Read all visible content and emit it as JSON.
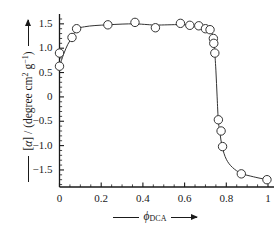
{
  "chart_data": {
    "type": "scatter",
    "title": "",
    "xlabel": "φ_DCA",
    "xlabel_parts": {
      "symbol": "ϕ",
      "subscript": "DCA"
    },
    "ylabel": "[α] / (degree cm² g⁻¹)",
    "ylabel_parts": {
      "bracket_open": "[",
      "symbol": "α",
      "bracket_close": "] / (degree cm",
      "sup1": "2",
      "mid": " g",
      "sup2": "−1",
      "tail": ")"
    },
    "xlim": [
      0,
      1
    ],
    "ylim": [
      -1.85,
      1.62
    ],
    "xticks": [
      0,
      0.2,
      0.4,
      0.6,
      0.8,
      1
    ],
    "xtick_labels": [
      "0",
      "0.2",
      "0.4",
      "0.6",
      "0.8",
      "1"
    ],
    "xminor_step": 0.05,
    "yticks": [
      1.5,
      1.0,
      0.5,
      0,
      -0.5,
      -1.0,
      -1.5
    ],
    "ytick_labels": [
      "1.5",
      "1.0",
      "0.5",
      "0",
      "−0.5",
      "−1.0",
      "−1.5"
    ],
    "yminor_step": 0.1,
    "grid": false,
    "legend": null,
    "frame": "left-bottom",
    "marker": "open-circle",
    "marker_size": 4.2,
    "line_color": "#333333",
    "marker_edge_color": "#333333",
    "marker_face_color": "#ffffff",
    "series": [
      {
        "name": "optical rotation vs DCA volume fraction",
        "points": [
          {
            "x": 0.0,
            "y": 0.9
          },
          {
            "x": 0.0,
            "y": 0.63
          },
          {
            "x": 0.06,
            "y": 1.22
          },
          {
            "x": 0.082,
            "y": 1.4
          },
          {
            "x": 0.232,
            "y": 1.48
          },
          {
            "x": 0.362,
            "y": 1.53
          },
          {
            "x": 0.46,
            "y": 1.42
          },
          {
            "x": 0.58,
            "y": 1.51
          },
          {
            "x": 0.625,
            "y": 1.47
          },
          {
            "x": 0.668,
            "y": 1.46
          },
          {
            "x": 0.7,
            "y": 1.4
          },
          {
            "x": 0.722,
            "y": 1.38
          },
          {
            "x": 0.738,
            "y": 1.2
          },
          {
            "x": 0.74,
            "y": 1.1
          },
          {
            "x": 0.745,
            "y": 0.9
          },
          {
            "x": 0.762,
            "y": -0.47
          },
          {
            "x": 0.775,
            "y": -0.7
          },
          {
            "x": 0.782,
            "y": -1.02
          },
          {
            "x": 0.872,
            "y": -1.58
          },
          {
            "x": 0.995,
            "y": -1.7
          }
        ]
      }
    ],
    "fit_curve": [
      {
        "x": 0.0,
        "y": 0.63
      },
      {
        "x": 0.02,
        "y": 0.88
      },
      {
        "x": 0.04,
        "y": 1.08
      },
      {
        "x": 0.06,
        "y": 1.22
      },
      {
        "x": 0.082,
        "y": 1.39
      },
      {
        "x": 0.12,
        "y": 1.44
      },
      {
        "x": 0.17,
        "y": 1.465
      },
      {
        "x": 0.232,
        "y": 1.48
      },
      {
        "x": 0.3,
        "y": 1.495
      },
      {
        "x": 0.362,
        "y": 1.5
      },
      {
        "x": 0.42,
        "y": 1.485
      },
      {
        "x": 0.46,
        "y": 1.475
      },
      {
        "x": 0.52,
        "y": 1.48
      },
      {
        "x": 0.58,
        "y": 1.485
      },
      {
        "x": 0.625,
        "y": 1.475
      },
      {
        "x": 0.668,
        "y": 1.455
      },
      {
        "x": 0.7,
        "y": 1.42
      },
      {
        "x": 0.722,
        "y": 1.37
      },
      {
        "x": 0.734,
        "y": 1.27
      },
      {
        "x": 0.742,
        "y": 1.05
      },
      {
        "x": 0.75,
        "y": 0.55
      },
      {
        "x": 0.756,
        "y": 0.0
      },
      {
        "x": 0.762,
        "y": -0.5
      },
      {
        "x": 0.77,
        "y": -0.75
      },
      {
        "x": 0.78,
        "y": -1.02
      },
      {
        "x": 0.8,
        "y": -1.28
      },
      {
        "x": 0.83,
        "y": -1.45
      },
      {
        "x": 0.872,
        "y": -1.57
      },
      {
        "x": 0.93,
        "y": -1.64
      },
      {
        "x": 0.995,
        "y": -1.7
      }
    ]
  },
  "axes": {
    "x_arrow_left": "—",
    "x_arrow_right": "→",
    "y_arrow_up": "↑",
    "y_rule": "—"
  }
}
